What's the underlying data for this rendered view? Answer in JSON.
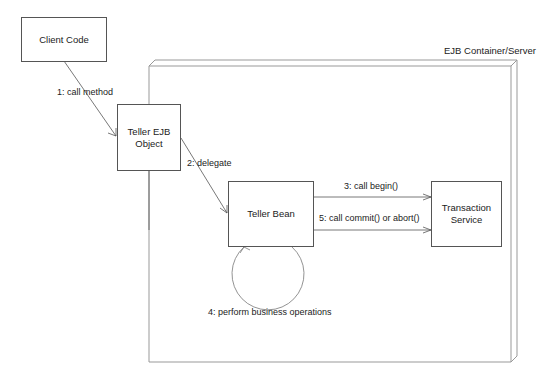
{
  "diagram": {
    "type": "collaboration-diagram",
    "container": {
      "label": "EJB Container/Server"
    },
    "nodes": [
      {
        "id": "client",
        "label": "Client Code"
      },
      {
        "id": "ejb_object",
        "label_line1": "Teller EJB",
        "label_line2": "Object"
      },
      {
        "id": "bean",
        "label": "Teller Bean"
      },
      {
        "id": "tx",
        "label_line1": "Transaction",
        "label_line2": "Service"
      }
    ],
    "messages": [
      {
        "from": "client",
        "to": "ejb_object",
        "label": "1: call method"
      },
      {
        "from": "ejb_object",
        "to": "bean",
        "label": "2: delegate"
      },
      {
        "from": "bean",
        "to": "tx",
        "label": "3: call begin()"
      },
      {
        "from": "bean",
        "to": "bean",
        "label": "4: perform business operations"
      },
      {
        "from": "bean",
        "to": "tx",
        "label": "5: call commit() or abort()"
      }
    ]
  }
}
